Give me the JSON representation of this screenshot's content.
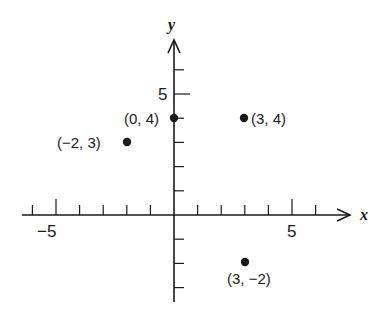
{
  "diagram": {
    "type": "cartesian-plane",
    "axes": {
      "x": {
        "label": "x",
        "range": [
          -6,
          6
        ],
        "labeled_ticks": [
          {
            "value": -5,
            "text": "−5"
          },
          {
            "value": 5,
            "text": "5"
          }
        ]
      },
      "y": {
        "label": "y",
        "range": [
          -3,
          6
        ],
        "labeled_ticks": [
          {
            "value": 5,
            "text": "5"
          }
        ]
      }
    },
    "points": [
      {
        "x": 0,
        "y": 4,
        "label": "(0, 4)"
      },
      {
        "x": -2,
        "y": 3,
        "label": "(−2, 3)"
      },
      {
        "x": 3,
        "y": 4,
        "label": "(3, 4)"
      },
      {
        "x": 3,
        "y": -2,
        "label": "(3, −2)"
      }
    ],
    "colors": {
      "ink": "#1a1a1a",
      "background": "#ffffff"
    }
  }
}
